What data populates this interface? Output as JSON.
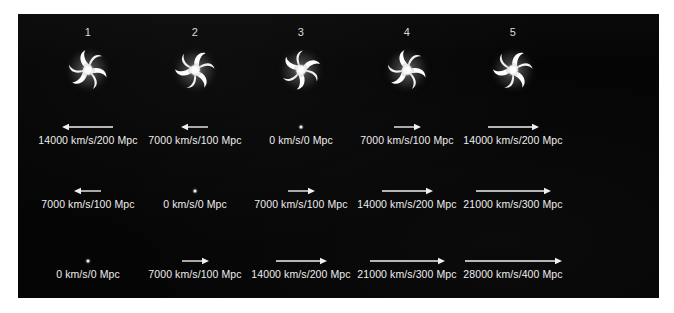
{
  "figure": {
    "background_color": "#ffffff",
    "panel_color": "#050505",
    "text_color": "#ededed",
    "galaxy_color": "#ffffff"
  },
  "columns": [
    {
      "label": "1"
    },
    {
      "label": "2"
    },
    {
      "label": "3"
    },
    {
      "label": "4"
    },
    {
      "label": "5"
    }
  ],
  "rows": [
    {
      "name": "row-1",
      "has_galaxies": true,
      "cells": [
        {
          "label": "14000 km/s/200 Mpc",
          "velocity": 14000,
          "distance": 200,
          "direction": "left",
          "arrow_length": 50
        },
        {
          "label": "7000 km/s/100 Mpc",
          "velocity": 7000,
          "distance": 100,
          "direction": "left",
          "arrow_length": 26
        },
        {
          "label": "0 km/s/0 Mpc",
          "velocity": 0,
          "distance": 0,
          "direction": "none",
          "arrow_length": 0
        },
        {
          "label": "7000 km/s/100 Mpc",
          "velocity": 7000,
          "distance": 100,
          "direction": "right",
          "arrow_length": 26
        },
        {
          "label": "14000 km/s/200 Mpc",
          "velocity": 14000,
          "distance": 200,
          "direction": "right",
          "arrow_length": 50
        }
      ]
    },
    {
      "name": "row-2",
      "has_galaxies": false,
      "cells": [
        {
          "label": "7000 km/s/100 Mpc",
          "velocity": 7000,
          "distance": 100,
          "direction": "left",
          "arrow_length": 26
        },
        {
          "label": "0 km/s/0 Mpc",
          "velocity": 0,
          "distance": 0,
          "direction": "none",
          "arrow_length": 0
        },
        {
          "label": "7000 km/s/100 Mpc",
          "velocity": 7000,
          "distance": 100,
          "direction": "right",
          "arrow_length": 26
        },
        {
          "label": "14000 km/s/200 Mpc",
          "velocity": 14000,
          "distance": 200,
          "direction": "right",
          "arrow_length": 50
        },
        {
          "label": "21000 km/s/300 Mpc",
          "velocity": 21000,
          "distance": 300,
          "direction": "right",
          "arrow_length": 74
        }
      ]
    },
    {
      "name": "row-3",
      "has_galaxies": false,
      "cells": [
        {
          "label": "0 km/s/0 Mpc",
          "velocity": 0,
          "distance": 0,
          "direction": "none",
          "arrow_length": 0
        },
        {
          "label": "7000 km/s/100 Mpc",
          "velocity": 7000,
          "distance": 100,
          "direction": "right",
          "arrow_length": 26
        },
        {
          "label": "14000 km/s/200 Mpc",
          "velocity": 14000,
          "distance": 200,
          "direction": "right",
          "arrow_length": 50
        },
        {
          "label": "21000 km/s/300 Mpc",
          "velocity": 21000,
          "distance": 300,
          "direction": "right",
          "arrow_length": 74
        },
        {
          "label": "28000 km/s/400 Mpc",
          "velocity": 28000,
          "distance": 400,
          "direction": "right",
          "arrow_length": 96
        }
      ]
    }
  ],
  "chart_data": {
    "type": "table",
    "title": "",
    "xlabel": "",
    "ylabel": "",
    "categories": [
      "1",
      "2",
      "3",
      "4",
      "5"
    ],
    "series": [
      {
        "name": "row-1 recession velocity (km/s)",
        "values": [
          -14000,
          -7000,
          0,
          7000,
          14000
        ]
      },
      {
        "name": "row-2 recession velocity (km/s)",
        "values": [
          -7000,
          0,
          7000,
          14000,
          21000
        ]
      },
      {
        "name": "row-3 recession velocity (km/s)",
        "values": [
          0,
          7000,
          14000,
          21000,
          28000
        ]
      }
    ],
    "distances_mpc": [
      [
        200,
        100,
        0,
        100,
        200
      ],
      [
        100,
        0,
        100,
        200,
        300
      ],
      [
        0,
        100,
        200,
        300,
        400
      ]
    ],
    "labels": [
      [
        "14000 km/s/200 Mpc",
        "7000 km/s/100 Mpc",
        "0 km/s/0 Mpc",
        "7000 km/s/100 Mpc",
        "14000 km/s/200 Mpc"
      ],
      [
        "7000 km/s/100 Mpc",
        "0 km/s/0 Mpc",
        "7000 km/s/100 Mpc",
        "14000 km/s/200 Mpc",
        "21000 km/s/300 Mpc"
      ],
      [
        "0 km/s/0 Mpc",
        "7000 km/s/100 Mpc",
        "14000 km/s/200 Mpc",
        "21000 km/s/300 Mpc",
        "28000 km/s/400 Mpc"
      ]
    ],
    "legend": [],
    "grid": false
  }
}
